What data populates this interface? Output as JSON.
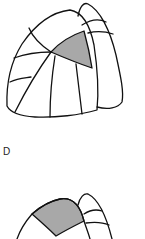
{
  "figure": {
    "type": "lung segment diagram",
    "panels": [
      {
        "id": "upper",
        "description": "lateral view of lung lobes with segment boundaries, one segment shaded"
      },
      {
        "id": "D",
        "label": "D",
        "description": "partial view of lung with upper segment shaded"
      }
    ],
    "panel_label": "D",
    "colors": {
      "shaded_segment": "#a8a8a8",
      "outline": "#111111",
      "background": "#ffffff"
    }
  }
}
